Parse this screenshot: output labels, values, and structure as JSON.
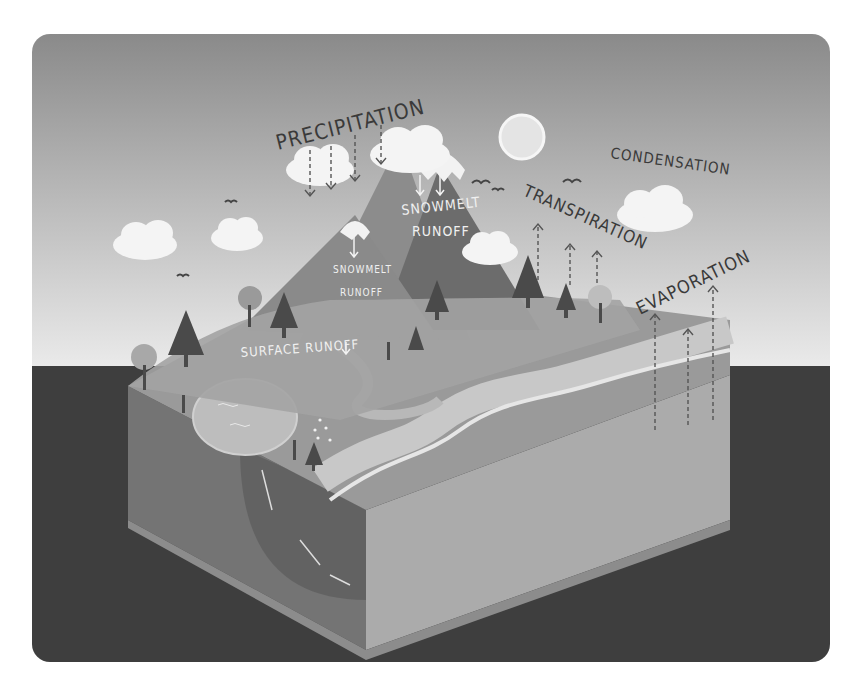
{
  "diagram": {
    "labels": {
      "precipitation": "PRECIPITATION",
      "condensation": "CONDENSATION",
      "transpiration": "TRANSPIRATION",
      "evaporation": "EVAPORATION",
      "snowmelt_runoff_large_1": "SNOWMELT",
      "snowmelt_runoff_large_2": "RUNOFF",
      "snowmelt_runoff_small_1": "SNOWMELT",
      "snowmelt_runoff_small_2": "RUNOFF",
      "surface_runoff": "SURFACE RUNOFF"
    },
    "colors": {
      "sky_top": "#8a8a8a",
      "sky_bottom": "#e6e6e6",
      "ground_dark": "#3e3e3e",
      "block_top": "#9c9c9c",
      "block_side_left": "#7a7a7a",
      "block_side_right": "#b0b0b0",
      "mountain_dark": "#6a6a6a",
      "mountain_light": "#8e8e8e",
      "tree_dark": "#4a4a4a",
      "cloud": "#f4f4f4",
      "sun": "#e8e8e8",
      "label_dark": "#3a3a3a",
      "label_light": "#f0f0f0"
    }
  }
}
